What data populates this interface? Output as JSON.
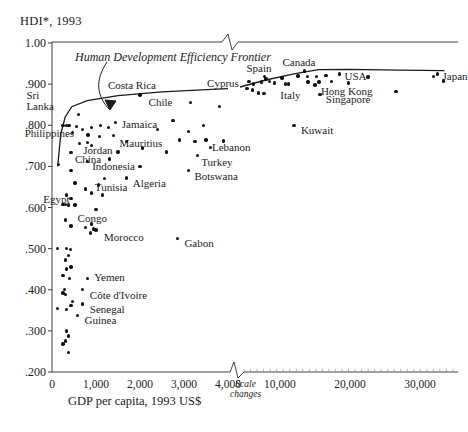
{
  "axes": {
    "y_title": "HDI*, 1993",
    "y_ticks": [
      "1.00",
      ".900",
      ".800",
      ".700",
      ".600",
      ".500",
      ".400",
      ".300",
      ".200"
    ],
    "x_label": "GDP per capita, 1993 US$",
    "x_ticks_left": [
      "0",
      "1,000",
      "2,000",
      "3,000",
      "4,000"
    ],
    "x_ticks_right": [
      "10,000",
      "20,000",
      "30,000"
    ],
    "scale_break_note": "Scale\nchanges",
    "scale_break_line1": "Scale",
    "scale_break_line2": "changes"
  },
  "annotations": {
    "frontier_label": "Human Development Efficiency Frontier"
  },
  "chart_data": {
    "type": "scatter",
    "title": "",
    "xlabel": "GDP per capita, 1993 US$",
    "ylabel": "HDI*, 1993",
    "ylim": [
      0.2,
      1.0
    ],
    "xlim_left_panel": [
      0,
      4000
    ],
    "xlim_right_panel": [
      4000,
      35000
    ],
    "axis_break": true,
    "grid": false,
    "legend": null,
    "frontier_curve": {
      "name": "Human Development Efficiency Frontier",
      "description": "Upper envelope curve rising steeply from about HDI .70 near zero GDP to about .89 at 4,000 US$, continuing to about .93 at 15,000 US$ then flat to the right edge.",
      "points_left": [
        [
          130,
          0.7
        ],
        [
          200,
          0.78
        ],
        [
          300,
          0.82
        ],
        [
          450,
          0.845
        ],
        [
          800,
          0.86
        ],
        [
          1500,
          0.872
        ],
        [
          2500,
          0.881
        ],
        [
          3400,
          0.886
        ],
        [
          4000,
          0.889
        ]
      ],
      "points_right": [
        [
          4300,
          0.893
        ],
        [
          8000,
          0.91
        ],
        [
          12000,
          0.925
        ],
        [
          15500,
          0.935
        ],
        [
          20000,
          0.936
        ],
        [
          27000,
          0.934
        ],
        [
          33500,
          0.933
        ]
      ]
    },
    "labeled_points": [
      {
        "label": "Sri Lanka",
        "x": 600,
        "y": 0.826,
        "panel": "left",
        "label_dx": -52,
        "label_dy": -24,
        "lines": 2
      },
      {
        "label": "Costa Rica",
        "x": 2000,
        "y": 0.874,
        "panel": "left",
        "label_dx": -32,
        "label_dy": -14
      },
      {
        "label": "Chile",
        "x": 3150,
        "y": 0.855,
        "panel": "left",
        "label_dx": -42,
        "label_dy": -5
      },
      {
        "label": "Philippines",
        "x": 560,
        "y": 0.797,
        "panel": "left",
        "label_dx": -52,
        "label_dy": 3
      },
      {
        "label": "Jamaica",
        "x": 1450,
        "y": 0.807,
        "panel": "left",
        "label_dx": 6,
        "label_dy": -2
      },
      {
        "label": "Mauritius",
        "x": 2900,
        "y": 0.764,
        "panel": "left",
        "label_dx": -60,
        "label_dy": -1
      },
      {
        "label": "Lebanon",
        "x": 3500,
        "y": 0.764,
        "panel": "left",
        "label_dx": 6,
        "label_dy": 3
      },
      {
        "label": "Jordan",
        "x": 800,
        "y": 0.758,
        "panel": "left",
        "label_dx": -4,
        "label_dy": 3
      },
      {
        "label": "China",
        "x": 430,
        "y": 0.733,
        "panel": "left",
        "label_dx": 4,
        "label_dy": 2
      },
      {
        "label": "Turkey",
        "x": 3300,
        "y": 0.727,
        "panel": "left",
        "label_dx": 4,
        "label_dy": 3
      },
      {
        "label": "Indonesia",
        "x": 800,
        "y": 0.712,
        "panel": "left",
        "label_dx": 5,
        "label_dy": 1
      },
      {
        "label": "Botswana",
        "x": 3100,
        "y": 0.69,
        "panel": "left",
        "label_dx": 6,
        "label_dy": 2
      },
      {
        "label": "Tunisia",
        "x": 1200,
        "y": 0.67,
        "panel": "left",
        "label_dx": -10,
        "label_dy": 4
      },
      {
        "label": "Algeria",
        "x": 1700,
        "y": 0.672,
        "panel": "left",
        "label_dx": 6,
        "label_dy": 1
      },
      {
        "label": "Egypt",
        "x": 300,
        "y": 0.608,
        "panel": "left",
        "label_dx": -22,
        "label_dy": -9
      },
      {
        "label": "Congo",
        "x": 900,
        "y": 0.56,
        "panel": "left",
        "label_dx": -14,
        "label_dy": -10
      },
      {
        "label": "Morocco",
        "x": 1000,
        "y": 0.545,
        "panel": "left",
        "label_dx": 8,
        "label_dy": 3
      },
      {
        "label": "Yemen",
        "x": 800,
        "y": 0.428,
        "panel": "left",
        "label_dx": 7,
        "label_dy": 0
      },
      {
        "label": "Côte d'Ivoire",
        "x": 700,
        "y": 0.4,
        "panel": "left",
        "label_dx": 7,
        "label_dy": 1
      },
      {
        "label": "Senegal",
        "x": 700,
        "y": 0.365,
        "panel": "left",
        "label_dx": 7,
        "label_dy": 1
      },
      {
        "label": "Guinea",
        "x": 580,
        "y": 0.338,
        "panel": "left",
        "label_dx": 7,
        "label_dy": 1
      },
      {
        "label": "Gabon",
        "x": 2850,
        "y": 0.525,
        "panel": "left",
        "label_dx": 7,
        "label_dy": 1
      },
      {
        "label": "Cyprus",
        "x": 5600,
        "y": 0.907,
        "panel": "right",
        "label_dx": -42,
        "label_dy": -2
      },
      {
        "label": "Spain",
        "x": 7800,
        "y": 0.918,
        "panel": "right",
        "label_dx": -18,
        "label_dy": -13
      },
      {
        "label": "Canada",
        "x": 13500,
        "y": 0.932,
        "panel": "right",
        "label_dx": -22,
        "label_dy": -13
      },
      {
        "label": "USA",
        "x": 18500,
        "y": 0.925,
        "panel": "right",
        "label_dx": 5,
        "label_dy": -2
      },
      {
        "label": "Japan",
        "x": 32500,
        "y": 0.925,
        "panel": "right",
        "label_dx": 5,
        "label_dy": -2
      },
      {
        "label": "Italy",
        "x": 11200,
        "y": 0.9,
        "panel": "right",
        "label_dx": -8,
        "label_dy": 7
      },
      {
        "label": "Hong Kong",
        "x": 15000,
        "y": 0.898,
        "panel": "right",
        "label_dx": 6,
        "label_dy": 2
      },
      {
        "label": "Singapore",
        "x": 15700,
        "y": 0.875,
        "panel": "right",
        "label_dx": 6,
        "label_dy": 1
      },
      {
        "label": "Kuwait",
        "x": 12000,
        "y": 0.8,
        "panel": "right",
        "label_dx": 7,
        "label_dy": 1
      }
    ],
    "unlabeled_points_left": [
      [
        150,
        0.705
      ],
      [
        250,
        0.8
      ],
      [
        330,
        0.8
      ],
      [
        390,
        0.8
      ],
      [
        470,
        0.783
      ],
      [
        700,
        0.79
      ],
      [
        900,
        0.795
      ],
      [
        1100,
        0.8
      ],
      [
        1280,
        0.795
      ],
      [
        820,
        0.776
      ],
      [
        1080,
        0.772
      ],
      [
        1400,
        0.775
      ],
      [
        620,
        0.756
      ],
      [
        900,
        0.751
      ],
      [
        1700,
        0.76
      ],
      [
        2400,
        0.79
      ],
      [
        2750,
        0.812
      ],
      [
        3100,
        0.785
      ],
      [
        3450,
        0.8
      ],
      [
        3800,
        0.845
      ],
      [
        3900,
        0.762
      ],
      [
        3600,
        0.746
      ],
      [
        3250,
        0.76
      ],
      [
        2600,
        0.735
      ],
      [
        2050,
        0.745
      ],
      [
        1500,
        0.735
      ],
      [
        1300,
        0.718
      ],
      [
        2000,
        0.7
      ],
      [
        430,
        0.69
      ],
      [
        520,
        0.66
      ],
      [
        760,
        0.645
      ],
      [
        1050,
        0.655
      ],
      [
        330,
        0.63
      ],
      [
        430,
        0.622
      ],
      [
        250,
        0.608
      ],
      [
        380,
        0.606
      ],
      [
        520,
        0.606
      ],
      [
        900,
        0.635
      ],
      [
        1150,
        0.63
      ],
      [
        1000,
        0.595
      ],
      [
        300,
        0.57
      ],
      [
        430,
        0.555
      ],
      [
        760,
        0.552
      ],
      [
        950,
        0.548
      ],
      [
        880,
        0.538
      ],
      [
        130,
        0.5
      ],
      [
        330,
        0.5
      ],
      [
        420,
        0.498
      ],
      [
        380,
        0.483
      ],
      [
        300,
        0.472
      ],
      [
        430,
        0.455
      ],
      [
        330,
        0.45
      ],
      [
        250,
        0.435
      ],
      [
        400,
        0.428
      ],
      [
        280,
        0.4
      ],
      [
        250,
        0.392
      ],
      [
        300,
        0.388
      ],
      [
        470,
        0.372
      ],
      [
        130,
        0.355
      ],
      [
        330,
        0.352
      ],
      [
        430,
        0.362
      ],
      [
        330,
        0.3
      ],
      [
        380,
        0.288
      ],
      [
        300,
        0.275
      ],
      [
        250,
        0.268
      ],
      [
        380,
        0.248
      ]
    ],
    "unlabeled_points_right": [
      [
        6200,
        0.9
      ],
      [
        7400,
        0.905
      ],
      [
        8000,
        0.912
      ],
      [
        8500,
        0.907
      ],
      [
        9200,
        0.903
      ],
      [
        10300,
        0.915
      ],
      [
        10800,
        0.9
      ],
      [
        12600,
        0.92
      ],
      [
        13900,
        0.918
      ],
      [
        15200,
        0.919
      ],
      [
        16600,
        0.921
      ],
      [
        14000,
        0.905
      ],
      [
        15600,
        0.905
      ],
      [
        17400,
        0.906
      ],
      [
        19800,
        0.903
      ],
      [
        22600,
        0.917
      ],
      [
        31900,
        0.918
      ],
      [
        33400,
        0.908
      ],
      [
        5300,
        0.89
      ],
      [
        6100,
        0.886
      ],
      [
        6900,
        0.878
      ],
      [
        7700,
        0.877
      ],
      [
        26600,
        0.882
      ]
    ]
  },
  "source_note": ""
}
